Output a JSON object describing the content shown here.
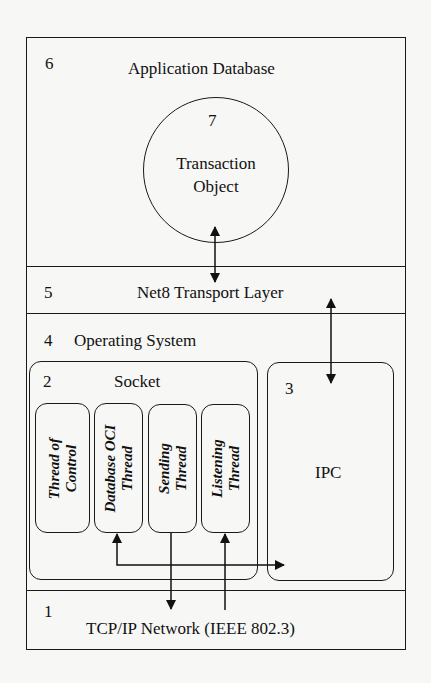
{
  "diagram": {
    "layers": [
      {
        "number": "6",
        "label": "Application Database"
      },
      {
        "number": "5",
        "label": "Net8 Transport Layer"
      },
      {
        "number": "4",
        "label": "Operating System"
      },
      {
        "number": "1",
        "label": "TCP/IP Network (IEEE 802.3)"
      }
    ],
    "transaction_object": {
      "number": "7",
      "line1": "Transaction",
      "line2": "Object"
    },
    "socket": {
      "number": "2",
      "label": "Socket",
      "threads": [
        {
          "line1": "Thread of",
          "line2": "Control"
        },
        {
          "line1": "Database OCI",
          "line2": "Thread"
        },
        {
          "line1": "Sending",
          "line2": "Thread"
        },
        {
          "line1": "Listening",
          "line2": "Thread"
        }
      ]
    },
    "ipc": {
      "number": "3",
      "label": "IPC"
    },
    "connections": [
      {
        "from": "Transaction Object",
        "to": "Net8 Transport Layer",
        "type": "bidirectional"
      },
      {
        "from": "Net8 Transport Layer",
        "to": "IPC",
        "type": "bidirectional"
      },
      {
        "from": "Database OCI Thread",
        "to": "IPC",
        "type": "bidirectional"
      },
      {
        "from": "Sending Thread",
        "to": "TCP/IP Network (IEEE 802.3)",
        "type": "directed"
      },
      {
        "from": "TCP/IP Network (IEEE 802.3)",
        "to": "Listening Thread",
        "type": "directed"
      }
    ]
  }
}
